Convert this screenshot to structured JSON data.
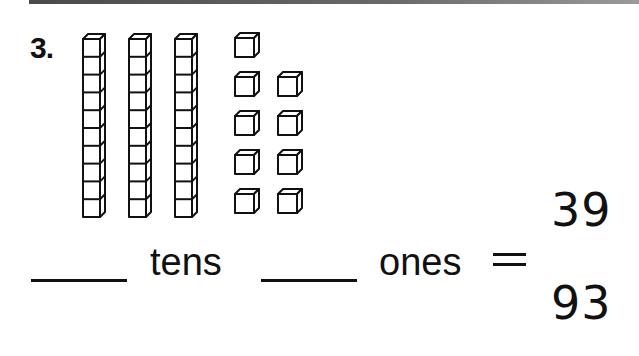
{
  "worksheet": {
    "problem_number": "3.",
    "blocks": {
      "tens_rods": 3,
      "cubes_per_rod": 10,
      "ones_cubes": 9
    },
    "prompt": {
      "blank_tens": "",
      "tens_label": "tens",
      "blank_ones": "",
      "ones_label": "ones",
      "equals_sign": "="
    },
    "choices": [
      {
        "label": "39"
      },
      {
        "label": "93"
      }
    ]
  }
}
